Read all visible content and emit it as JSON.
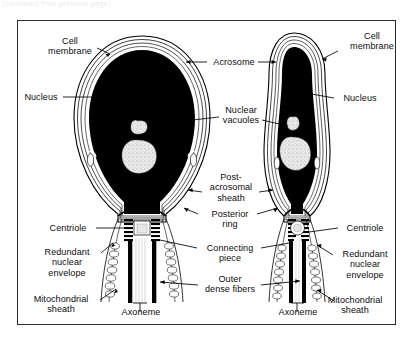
{
  "figure": {
    "kind": "anatomical-line-diagram",
    "top_edge_artifact": "(continued from previous page)",
    "border_color": "#2b2b2b",
    "ink_color": "#000000",
    "paper_color": "#ffffff",
    "specimens": [
      {
        "name": "oval-head-sperm",
        "head_shape": "broad oval"
      },
      {
        "name": "tapered-head-sperm",
        "head_shape": "narrow elongated"
      }
    ]
  },
  "labels": {
    "cell_membrane_left": "Cell\nmembrane",
    "nucleus_left": "Nucleus",
    "centriole_left": "Centriole",
    "redundant_nuclear_envelope_left": "Redundant\nnuclear\nenvelope",
    "mitochondrial_sheath_left": "Mitochondrial\nsheath",
    "axoneme_left": "Axoneme",
    "acrosome": "Acrosome",
    "nuclear_vacuoles": "Nuclear\nvacuoles",
    "post_acrosomal_sheath": "Post-\nacrosomal\nsheath",
    "posterior_ring": "Posterior\nring",
    "connecting_piece": "Connecting\npiece",
    "outer_dense_fibers": "Outer\ndense fibers",
    "cell_membrane_right": "Cell\nmembrane",
    "nucleus_right": "Nucleus",
    "centriole_right": "Centriole",
    "redundant_nuclear_envelope_right": "Redundant\nnuclear\nenvelope",
    "mitochondrial_sheath_right": "Mitochondrial\nsheath",
    "axoneme_right": "Axoneme"
  }
}
